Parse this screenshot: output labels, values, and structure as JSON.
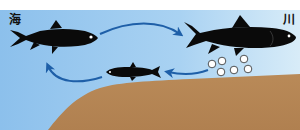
{
  "diagram": {
    "title": "",
    "labels": {
      "sea": "海",
      "river": "川"
    },
    "stages": [
      {
        "id": "adult-sea",
        "description": "adult fish in sea"
      },
      {
        "id": "adult-river",
        "description": "adult fish migrating upriver"
      },
      {
        "id": "eggs",
        "description": "eggs laid in riverbed",
        "count": 7
      },
      {
        "id": "juvenile",
        "description": "juvenile fish returning to sea"
      }
    ],
    "arrows": [
      {
        "from": "adult-sea",
        "to": "adult-river"
      },
      {
        "from": "eggs",
        "to": "juvenile"
      },
      {
        "from": "juvenile",
        "to": "adult-sea"
      }
    ],
    "colors": {
      "water": "#8fc3ee",
      "water_light": "#d6ebf8",
      "ground": "#b8885a",
      "ground_dark": "#a87848",
      "fish": "#0a0a0a",
      "arrow": "#1e5fa8",
      "egg_fill": "#ffffff",
      "egg_stroke": "#2a2a2a"
    }
  }
}
